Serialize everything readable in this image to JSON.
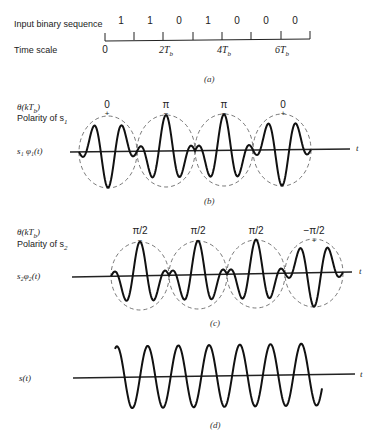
{
  "panel_a": {
    "row1_label": "Input binary sequence",
    "row2_label": "Time scale",
    "bits": [
      "1",
      "1",
      "0",
      "1",
      "0",
      "0",
      "0"
    ],
    "time_labels": [
      "0",
      "2T",
      "4T",
      "6T"
    ],
    "time_subscript": "b",
    "caption": "(a)"
  },
  "panel_b": {
    "theta_label": "θ(kT",
    "theta_sub": "b",
    "theta_close": ")",
    "polarity_label": "Polarity of s",
    "polarity_sub": "1",
    "signal_label": "s₁ φ₁(t)",
    "phases": [
      "0",
      "π",
      "π",
      "0"
    ],
    "polarities": [
      "+",
      "−",
      "−",
      "+"
    ],
    "axis_label": "t",
    "caption": "(b)"
  },
  "panel_c": {
    "theta_label": "θ(kT",
    "theta_sub": "b",
    "theta_close": ")",
    "polarity_label": "Polarity of s",
    "polarity_sub": "2",
    "signal_label": "s₂φ₂(t)",
    "phases": [
      "π/2",
      "π/2",
      "π/2",
      "−π/2"
    ],
    "polarities": [
      "−",
      "−",
      "−",
      "+"
    ],
    "axis_label": "t",
    "caption": "(c)"
  },
  "panel_d": {
    "signal_label": "s(t)",
    "axis_label": "t",
    "caption": "(d)"
  }
}
